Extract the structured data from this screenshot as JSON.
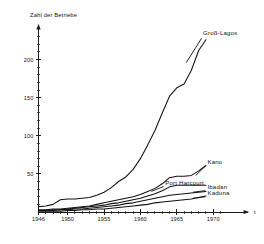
{
  "chart_data": {
    "type": "line",
    "title": "",
    "subtitle": "",
    "ylabel": "Zahl der Betriebe",
    "xlabel": "",
    "axis_end_symbol": "t",
    "xlim": [
      1946,
      1972
    ],
    "ylim": [
      0,
      240
    ],
    "grid": false,
    "legend_position": "inline-right",
    "y_ticks_major": [
      50,
      100,
      150,
      200
    ],
    "y_tick_labels": [
      "50",
      "100",
      "150",
      "200"
    ],
    "y_ticks_minor": [
      10,
      20,
      30,
      40,
      60,
      70,
      80,
      90,
      110,
      120,
      130,
      140,
      160,
      170,
      180,
      190,
      210,
      220,
      230
    ],
    "x_ticks_major": [
      1946,
      1950,
      1955,
      1960,
      1965,
      1970
    ],
    "x_tick_labels": [
      "1946",
      "1950",
      "1955",
      "1960",
      "1965",
      "1970"
    ],
    "x_ticks_minor": [
      1947,
      1948,
      1949,
      1951,
      1952,
      1953,
      1954,
      1956,
      1957,
      1958,
      1959,
      1961,
      1962,
      1963,
      1964,
      1966,
      1967,
      1968,
      1969,
      1971
    ],
    "x": [
      1946,
      1947,
      1948,
      1949,
      1950,
      1951,
      1952,
      1953,
      1954,
      1955,
      1956,
      1957,
      1958,
      1959,
      1960,
      1961,
      1962,
      1963,
      1964,
      1965,
      1966,
      1967,
      1968,
      1969
    ],
    "series": [
      {
        "name": "Groß-Lagos",
        "label": "Groß-Lagos",
        "color": "#111111",
        "values": [
          7,
          8,
          10,
          16,
          17,
          17,
          18,
          19,
          22,
          26,
          32,
          40,
          46,
          56,
          70,
          88,
          107,
          130,
          152,
          163,
          168,
          186,
          212,
          226
        ]
      },
      {
        "name": "Kano",
        "label": "Kano",
        "color": "#111111",
        "values": [
          3,
          3,
          4,
          4,
          5,
          6,
          7,
          8,
          10,
          12,
          14,
          16,
          18,
          20,
          23,
          27,
          31,
          37,
          45,
          47,
          47,
          48,
          54,
          61
        ]
      },
      {
        "name": "Port Harcourt",
        "label": "Port Harcourt",
        "color": "#111111",
        "values": [
          2,
          2,
          3,
          3,
          4,
          5,
          6,
          7,
          8,
          9,
          11,
          12,
          14,
          16,
          18,
          21,
          24,
          28,
          33,
          35,
          35,
          35,
          35,
          35
        ]
      },
      {
        "name": "Ibadan",
        "label": "Ibadan",
        "color": "#111111",
        "values": [
          2,
          2,
          2,
          3,
          3,
          4,
          4,
          5,
          6,
          7,
          8,
          9,
          11,
          12,
          14,
          16,
          18,
          20,
          22,
          23,
          24,
          25,
          26,
          27
        ]
      },
      {
        "name": "Kaduna",
        "label": "Kaduna",
        "color": "#111111",
        "values": [
          1,
          1,
          1,
          1,
          2,
          2,
          3,
          3,
          4,
          4,
          5,
          6,
          7,
          8,
          9,
          10,
          12,
          13,
          14,
          15,
          16,
          17,
          19,
          21
        ]
      }
    ],
    "annotations": [
      {
        "text": "Groß-Lagos",
        "x": 1968.6,
        "y": 232,
        "anchor": "start"
      },
      {
        "text": "Kano",
        "x": 1969.2,
        "y": 63,
        "anchor": "start"
      },
      {
        "text": "Port Harcourt",
        "x": 1963.4,
        "y": 35,
        "anchor": "start"
      },
      {
        "text": "Ibadan",
        "x": 1969.2,
        "y": 30,
        "anchor": "start"
      },
      {
        "text": "Kaduna",
        "x": 1969.2,
        "y": 22,
        "anchor": "start"
      }
    ]
  }
}
